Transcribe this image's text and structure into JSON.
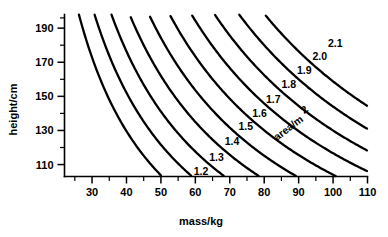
{
  "chart_data": {
    "type": "line",
    "title": "",
    "subtitle": "",
    "xlabel": "mass/kg",
    "ylabel": "height/cm",
    "xlim": [
      22,
      110
    ],
    "ylim": [
      103,
      198
    ],
    "grid": false,
    "legend_position": "inline-contour-labels",
    "series_label": "area/m",
    "series_label_exponent": "2",
    "x_ticks_major": [
      30,
      40,
      50,
      60,
      70,
      80,
      90,
      100,
      110
    ],
    "x_ticks_major_labels": [
      "30",
      "40",
      "50",
      "60",
      "70",
      "80",
      "90",
      "100",
      "110"
    ],
    "x_ticks_minor": [
      25,
      35,
      45,
      55,
      65,
      75,
      85,
      95,
      105
    ],
    "y_ticks_major": [
      110,
      130,
      150,
      170,
      190
    ],
    "y_ticks_major_labels": [
      "110",
      "130",
      "150",
      "170",
      "190"
    ],
    "y_ticks_minor": [
      120,
      140,
      160,
      180
    ],
    "contour_formula": "area = sqrt(height_cm * mass_kg / 3600)",
    "series": [
      {
        "name": "1.2",
        "value": 1.2,
        "label": "1.2",
        "label_x": 58.5,
        "label_y": 106.5
      },
      {
        "name": "1.3",
        "value": 1.3,
        "label": "1.3",
        "label_x": 63.0,
        "label_y": 114.5
      },
      {
        "name": "1.4",
        "value": 1.4,
        "label": "1.4",
        "label_x": 67.5,
        "label_y": 124.0
      },
      {
        "name": "1.5",
        "value": 1.5,
        "label": "1.5",
        "label_x": 71.5,
        "label_y": 132.5
      },
      {
        "name": "1.6",
        "value": 1.6,
        "label": "1.6",
        "label_x": 75.5,
        "label_y": 140.5
      },
      {
        "name": "1.7",
        "value": 1.7,
        "label": "1.7",
        "label_x": 79.5,
        "label_y": 148.5
      },
      {
        "name": "1.8",
        "value": 1.8,
        "label": "1.8",
        "label_x": 84.0,
        "label_y": 157.0
      },
      {
        "name": "1.9",
        "value": 1.9,
        "label": "1.9",
        "label_x": 88.5,
        "label_y": 165.5
      },
      {
        "name": "2.0",
        "value": 2.0,
        "label": "2.0",
        "label_x": 93.0,
        "label_y": 173.5
      },
      {
        "name": "2.1",
        "value": 2.1,
        "label": "2.1",
        "label_x": 97.5,
        "label_y": 181.5
      }
    ]
  },
  "axes": {
    "x_title": "mass/kg",
    "y_title": "height/cm"
  }
}
